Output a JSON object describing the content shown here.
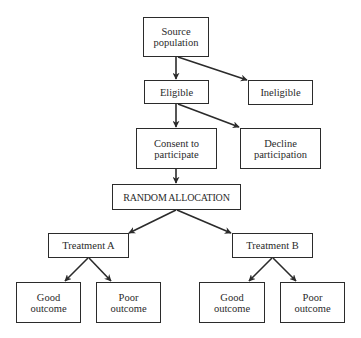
{
  "diagram": {
    "type": "flowchart",
    "title": "",
    "colors": {
      "line": "#2b2b2b",
      "box_fill": "#ffffff",
      "text": "#2a2a2a",
      "background": "#ffffff"
    },
    "nodes": {
      "source_population": {
        "label": "Source\npopulation"
      },
      "eligible": {
        "label": "Eligible"
      },
      "ineligible": {
        "label": "Ineligible"
      },
      "consent": {
        "label": "Consent to\nparticipate"
      },
      "decline": {
        "label": "Decline\nparticipation"
      },
      "random_allocation": {
        "label": "RANDOM ALLOCATION"
      },
      "treatment_a": {
        "label": "Treatment A"
      },
      "treatment_b": {
        "label": "Treatment B"
      },
      "good_outcome_a": {
        "label": "Good\noutcome"
      },
      "poor_outcome_a": {
        "label": "Poor\noutcome"
      },
      "good_outcome_b": {
        "label": "Good\noutcome"
      },
      "poor_outcome_b": {
        "label": "Poor\noutcome"
      }
    },
    "edges": [
      {
        "from": "source_population",
        "to": "eligible"
      },
      {
        "from": "source_population",
        "to": "ineligible"
      },
      {
        "from": "eligible",
        "to": "consent"
      },
      {
        "from": "eligible",
        "to": "decline"
      },
      {
        "from": "consent",
        "to": "random_allocation"
      },
      {
        "from": "random_allocation",
        "to": "treatment_a"
      },
      {
        "from": "random_allocation",
        "to": "treatment_b"
      },
      {
        "from": "treatment_a",
        "to": "good_outcome_a"
      },
      {
        "from": "treatment_a",
        "to": "poor_outcome_a"
      },
      {
        "from": "treatment_b",
        "to": "good_outcome_b"
      },
      {
        "from": "treatment_b",
        "to": "poor_outcome_b"
      }
    ]
  }
}
